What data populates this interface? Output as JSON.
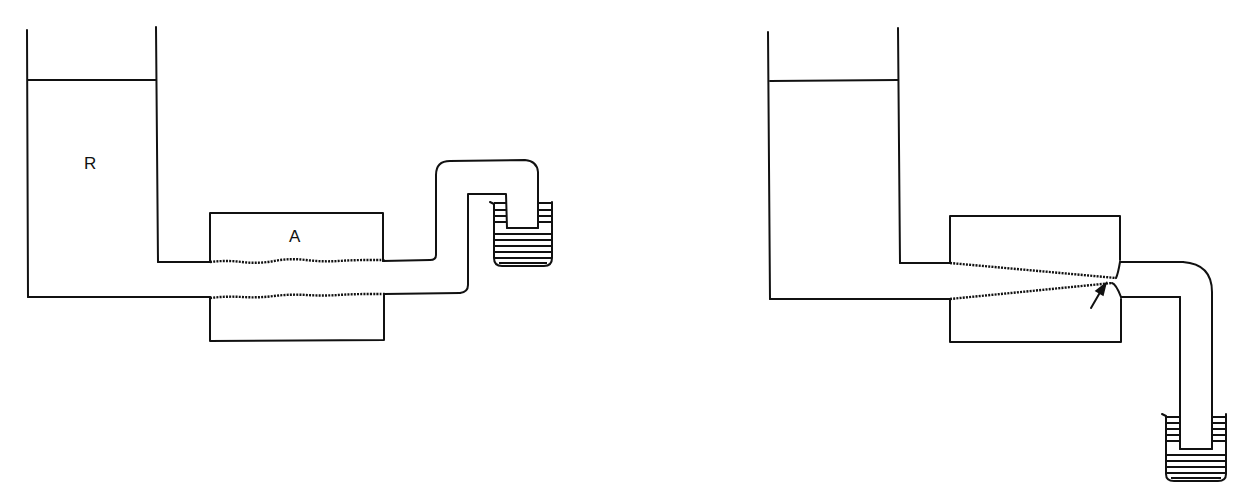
{
  "diagram": {
    "panels": [
      {
        "id": "left",
        "description": "Reservoir feeding a uniform channel through block A, siphoned into a beaker",
        "labels": {
          "reservoir": "R",
          "block": "A"
        }
      },
      {
        "id": "right",
        "description": "Reservoir feeding a tapered (converging) channel through block, draining down into a beaker",
        "labels": {
          "reservoir": "",
          "block": ""
        },
        "annotation": "arrow pointing at narrowest point of channel outlet"
      }
    ],
    "colors": {
      "line": "#111111",
      "background": "#ffffff"
    }
  }
}
